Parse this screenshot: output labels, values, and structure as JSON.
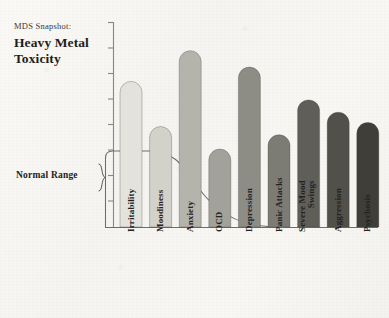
{
  "header": {
    "kicker": "MDS Snapshot:",
    "headline_line1": "Heavy Metal",
    "headline_line2": "Toxicity"
  },
  "annotations": {
    "normal_range_label": "Normal Range"
  },
  "colors": {
    "background": "#f8f7f4",
    "axis": "#7a7873",
    "curve": "#5c5a56",
    "box_outline": "#6f6d69",
    "text": "#23221f"
  },
  "chart_data": {
    "type": "bar",
    "title": "Heavy Metal Toxicity",
    "subtitle": "MDS Snapshot:",
    "xlabel": "",
    "ylabel": "",
    "grid": false,
    "legend": "none",
    "ylim": [
      0,
      100
    ],
    "categories": [
      "Irritability",
      "Moodiness",
      "Anxiety",
      "OCD",
      "Depression",
      "Panic Attacks",
      "Severe Mood Swings",
      "Aggression",
      "Psychosis"
    ],
    "values": [
      71,
      49,
      86,
      38,
      78,
      45,
      62,
      56,
      51
    ],
    "bar_colors": [
      "#e3e2dd",
      "#d2d1ca",
      "#b4b3ac",
      "#a2a19a",
      "#8d8c85",
      "#7c7b74",
      "#5f5e58",
      "#51504a",
      "#3f3e39"
    ],
    "annotations": [
      {
        "label": "Normal Range",
        "type": "band",
        "y_top": 42,
        "y_bottom": 0,
        "note": "shaded rounded region with declining S-curve ceiling"
      }
    ],
    "axis_ticks": 8
  }
}
